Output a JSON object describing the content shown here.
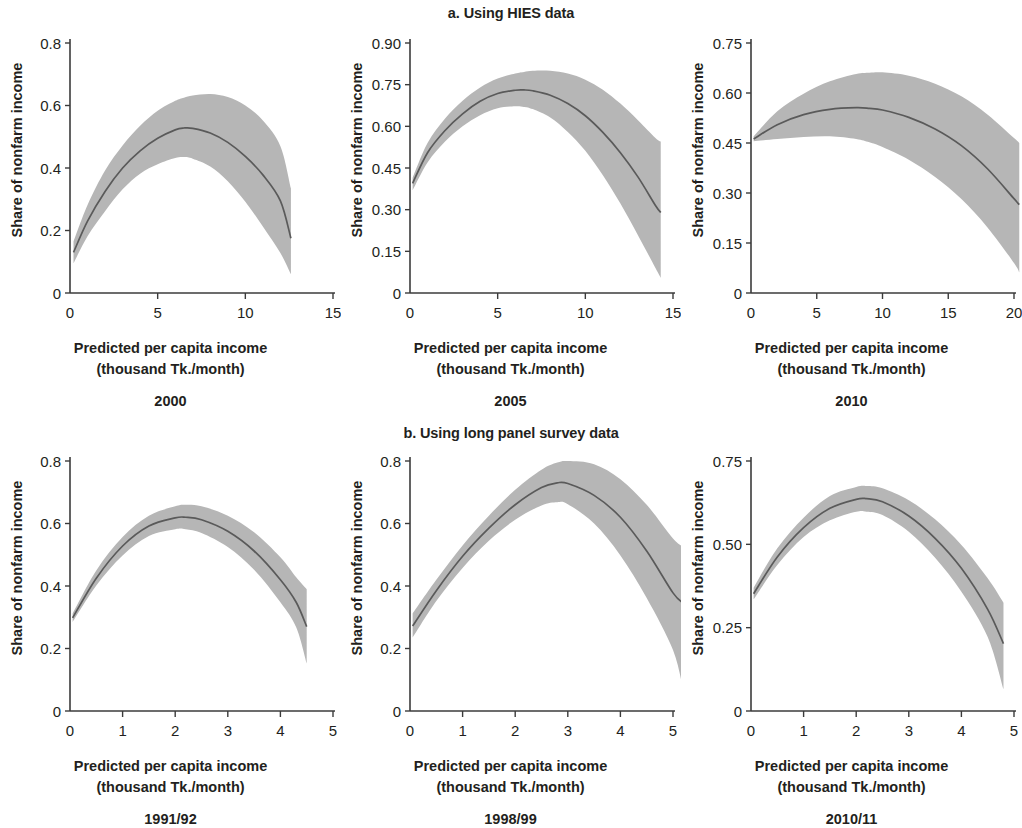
{
  "figure": {
    "section_a_title": "a. Using HIES data",
    "section_b_title": "b. Using long panel survey data",
    "xlabel_line1": "Predicted per capita income",
    "xlabel_line2": "(thousand Tk./month)",
    "ylabel": "Share of nonfarm income",
    "band_color": "#b6b6b6",
    "line_color": "#5a5a5a",
    "axis_color": "#3b3b3b"
  },
  "chart_data": [
    {
      "type": "line",
      "title": "2000",
      "panel": "a1",
      "xlabel": "Predicted per capita income (thousand Tk./month)",
      "ylabel": "Share of nonfarm income",
      "xlim": [
        0,
        15
      ],
      "ylim": [
        0,
        0.8
      ],
      "xticks": [
        0,
        5,
        10,
        15
      ],
      "xtick_labels": [
        "0",
        "5",
        "10",
        "15"
      ],
      "yticks": [
        0,
        0.2,
        0.4,
        0.6,
        0.8
      ],
      "ytick_labels": [
        "0",
        "0.2",
        "0.4",
        "0.6",
        "0.8"
      ],
      "grid": false,
      "legend": "none",
      "x": [
        0.2,
        1,
        2,
        3,
        4,
        5,
        6,
        6.5,
        7,
        8,
        9,
        10,
        11,
        12,
        12.6
      ],
      "fit": [
        0.13,
        0.23,
        0.325,
        0.4,
        0.455,
        0.495,
        0.522,
        0.528,
        0.527,
        0.512,
        0.482,
        0.437,
        0.378,
        0.295,
        0.175
      ],
      "ci_upper": [
        0.165,
        0.282,
        0.392,
        0.472,
        0.535,
        0.583,
        0.615,
        0.625,
        0.632,
        0.637,
        0.627,
        0.6,
        0.552,
        0.47,
        0.335
      ],
      "ci_lower": [
        0.095,
        0.182,
        0.262,
        0.332,
        0.382,
        0.412,
        0.432,
        0.435,
        0.43,
        0.405,
        0.358,
        0.292,
        0.213,
        0.128,
        0.06
      ]
    },
    {
      "type": "line",
      "title": "2005",
      "panel": "a2",
      "xlabel": "Predicted per capita income (thousand Tk./month)",
      "ylabel": "Share of nonfarm income",
      "xlim": [
        0,
        15
      ],
      "ylim": [
        0,
        0.9
      ],
      "xticks": [
        0,
        5,
        10,
        15
      ],
      "xtick_labels": [
        "0",
        "5",
        "10",
        "15"
      ],
      "yticks": [
        0,
        0.15,
        0.3,
        0.45,
        0.6,
        0.75,
        0.9
      ],
      "ytick_labels": [
        "0",
        "0.15",
        "0.30",
        "0.45",
        "0.60",
        "0.75",
        "0.90"
      ],
      "grid": false,
      "legend": "none",
      "x": [
        0.15,
        1,
        2,
        3,
        4,
        5,
        6,
        6.5,
        7,
        8,
        9,
        10,
        11,
        12,
        13,
        14,
        14.3
      ],
      "fit": [
        0.395,
        0.505,
        0.585,
        0.645,
        0.69,
        0.718,
        0.73,
        0.731,
        0.728,
        0.712,
        0.682,
        0.638,
        0.578,
        0.505,
        0.418,
        0.315,
        0.29
      ],
      "ci_upper": [
        0.415,
        0.54,
        0.628,
        0.692,
        0.74,
        0.772,
        0.79,
        0.796,
        0.8,
        0.8,
        0.79,
        0.768,
        0.732,
        0.682,
        0.622,
        0.558,
        0.545
      ],
      "ci_lower": [
        0.37,
        0.47,
        0.545,
        0.6,
        0.64,
        0.665,
        0.672,
        0.67,
        0.662,
        0.632,
        0.58,
        0.512,
        0.424,
        0.322,
        0.208,
        0.09,
        0.055
      ]
    },
    {
      "type": "line",
      "title": "2010",
      "panel": "a3",
      "xlabel": "Predicted per capita income (thousand Tk./month)",
      "ylabel": "Share of nonfarm income",
      "xlim": [
        0,
        20
      ],
      "ylim": [
        0,
        0.75
      ],
      "xticks": [
        0,
        5,
        10,
        15,
        20
      ],
      "xtick_labels": [
        "0",
        "5",
        "10",
        "15",
        "20"
      ],
      "yticks": [
        0,
        0.15,
        0.3,
        0.45,
        0.6,
        0.75
      ],
      "ytick_labels": [
        "0",
        "0.15",
        "0.30",
        "0.45",
        "0.60",
        "0.75"
      ],
      "grid": false,
      "legend": "none",
      "x": [
        0.2,
        2,
        4,
        6,
        8,
        9,
        10,
        12,
        14,
        16,
        18,
        20,
        20.4
      ],
      "fit": [
        0.462,
        0.505,
        0.535,
        0.551,
        0.556,
        0.554,
        0.549,
        0.527,
        0.492,
        0.442,
        0.372,
        0.283,
        0.265
      ],
      "ci_upper": [
        0.47,
        0.545,
        0.598,
        0.635,
        0.657,
        0.661,
        0.662,
        0.652,
        0.628,
        0.59,
        0.535,
        0.465,
        0.45
      ],
      "ci_lower": [
        0.455,
        0.462,
        0.468,
        0.47,
        0.462,
        0.452,
        0.438,
        0.4,
        0.348,
        0.282,
        0.196,
        0.09,
        0.062
      ]
    },
    {
      "type": "line",
      "title": "1991/92",
      "panel": "b1",
      "xlabel": "Predicted per capita income (thousand Tk./month)",
      "ylabel": "Share of nonfarm income",
      "xlim": [
        0,
        5
      ],
      "ylim": [
        0,
        0.8
      ],
      "xticks": [
        0,
        1,
        2,
        3,
        4,
        5
      ],
      "xtick_labels": [
        "0",
        "1",
        "2",
        "3",
        "4",
        "5"
      ],
      "yticks": [
        0,
        0.2,
        0.4,
        0.6,
        0.8
      ],
      "ytick_labels": [
        "0",
        "0.2",
        "0.4",
        "0.6",
        "0.8"
      ],
      "grid": false,
      "legend": "none",
      "x": [
        0.05,
        0.5,
        1,
        1.5,
        2,
        2.2,
        2.5,
        3,
        3.5,
        4,
        4.3,
        4.5
      ],
      "fit": [
        0.298,
        0.425,
        0.528,
        0.592,
        0.618,
        0.62,
        0.612,
        0.575,
        0.512,
        0.42,
        0.348,
        0.27
      ],
      "ci_upper": [
        0.312,
        0.45,
        0.557,
        0.625,
        0.655,
        0.66,
        0.655,
        0.625,
        0.572,
        0.492,
        0.428,
        0.39
      ],
      "ci_lower": [
        0.285,
        0.402,
        0.498,
        0.56,
        0.582,
        0.582,
        0.57,
        0.525,
        0.452,
        0.348,
        0.268,
        0.152
      ]
    },
    {
      "type": "line",
      "title": "1998/99",
      "panel": "b2",
      "xlabel": "Predicted per capita income (thousand Tk./month)",
      "ylabel": "Share of nonfarm income",
      "xlim": [
        0,
        5
      ],
      "ylim": [
        0,
        0.8
      ],
      "xticks": [
        0,
        1,
        2,
        3,
        4,
        5
      ],
      "xtick_labels": [
        "0",
        "1",
        "2",
        "3",
        "4",
        "5"
      ],
      "yticks": [
        0,
        0.2,
        0.4,
        0.6,
        0.8
      ],
      "ytick_labels": [
        "0",
        "0.2",
        "0.4",
        "0.6",
        "0.8"
      ],
      "grid": false,
      "legend": "none",
      "x": [
        0.05,
        0.5,
        1,
        1.5,
        2,
        2.5,
        2.8,
        3,
        3.5,
        4,
        4.5,
        5,
        5.2
      ],
      "fit": [
        0.272,
        0.385,
        0.495,
        0.585,
        0.66,
        0.715,
        0.73,
        0.728,
        0.69,
        0.62,
        0.512,
        0.378,
        0.345
      ],
      "ci_upper": [
        0.312,
        0.42,
        0.53,
        0.625,
        0.708,
        0.772,
        0.795,
        0.8,
        0.79,
        0.742,
        0.66,
        0.552,
        0.525
      ],
      "ci_lower": [
        0.235,
        0.352,
        0.458,
        0.545,
        0.612,
        0.658,
        0.668,
        0.662,
        0.6,
        0.498,
        0.362,
        0.195,
        0.062
      ]
    },
    {
      "type": "line",
      "title": "2010/11",
      "panel": "b3",
      "xlabel": "Predicted per capita income (thousand Tk./month)",
      "ylabel": "Share of nonfarm income",
      "xlim": [
        0,
        5
      ],
      "ylim": [
        0,
        0.75
      ],
      "xticks": [
        0,
        1,
        2,
        3,
        4,
        5
      ],
      "xtick_labels": [
        "0",
        "1",
        "2",
        "3",
        "4",
        "5"
      ],
      "yticks": [
        0,
        0.25,
        0.5,
        0.75
      ],
      "ytick_labels": [
        "0",
        "0.25",
        "0.50",
        "0.75"
      ],
      "grid": false,
      "legend": "none",
      "x": [
        0.05,
        0.5,
        1,
        1.5,
        2,
        2.2,
        2.5,
        3,
        3.5,
        4,
        4.5,
        4.8
      ],
      "fit": [
        0.352,
        0.462,
        0.55,
        0.608,
        0.635,
        0.637,
        0.628,
        0.585,
        0.518,
        0.428,
        0.305,
        0.202
      ],
      "ci_upper": [
        0.37,
        0.488,
        0.58,
        0.645,
        0.672,
        0.675,
        0.668,
        0.632,
        0.575,
        0.498,
        0.398,
        0.325
      ],
      "ci_lower": [
        0.335,
        0.438,
        0.522,
        0.572,
        0.598,
        0.598,
        0.588,
        0.538,
        0.46,
        0.358,
        0.222,
        0.065
      ]
    }
  ],
  "panel_layout": [
    {
      "key": "a1",
      "left": 0,
      "top": 25,
      "index": 0
    },
    {
      "key": "a2",
      "left": 340,
      "top": 25,
      "index": 1
    },
    {
      "key": "a3",
      "left": 681,
      "top": 25,
      "index": 2
    },
    {
      "key": "b1",
      "left": 0,
      "top": 443,
      "index": 3
    },
    {
      "key": "b2",
      "left": 340,
      "top": 443,
      "index": 4
    },
    {
      "key": "b3",
      "left": 681,
      "top": 443,
      "index": 5
    }
  ]
}
